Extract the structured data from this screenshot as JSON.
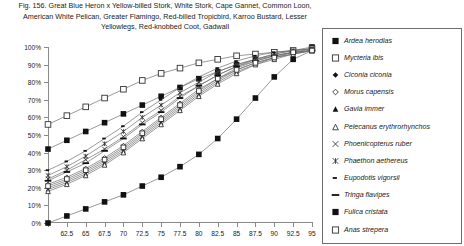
{
  "figure": {
    "title_lines": [
      "Fig. 156.  Great Blue Heron x Yellow-billed Stork, White Stork, Cape Gannet, Common Loon,",
      "American White Pelican, Greater Flamingo, Red-billed Tropicbird, Karroo Bustard, Lesser",
      "Yellowlegs, Red-knobbed Coot, Gadwall"
    ]
  },
  "chart_data": {
    "type": "line",
    "xlabel": "",
    "ylabel": "",
    "grid": false,
    "legend_position": "right",
    "xlim": [
      60,
      95
    ],
    "ylim": [
      0,
      100
    ],
    "x": [
      60,
      62.5,
      65,
      67.5,
      70,
      72.5,
      75,
      77.5,
      80,
      82.5,
      85,
      87.5,
      90,
      92.5,
      95
    ],
    "xticks": [
      "",
      "62.5",
      "65",
      "67.5",
      "70",
      "72.5",
      "75",
      "77.5",
      "80",
      "82.5",
      "85",
      "87.5",
      "90",
      "92.5",
      "95"
    ],
    "yticks": [
      "0%",
      "10%",
      "20%",
      "30%",
      "40%",
      "50%",
      "60%",
      "70%",
      "80%",
      "90%",
      "100%"
    ],
    "series": [
      {
        "name": "Ardea herodias",
        "marker": "filled-square",
        "values": [
          42,
          47,
          52,
          57,
          62,
          67,
          72,
          77,
          82,
          86,
          90,
          93,
          96,
          98,
          100
        ]
      },
      {
        "name": "Mycteria ibis",
        "marker": "open-square",
        "values": [
          56,
          61,
          66,
          71,
          76,
          81,
          85,
          88,
          91,
          93,
          95,
          96,
          97,
          98,
          99
        ]
      },
      {
        "name": "Ciconia ciconia",
        "marker": "filled-diamond",
        "values": [
          20,
          24,
          29,
          35,
          42,
          50,
          58,
          66,
          74,
          81,
          87,
          91,
          94,
          96,
          98
        ]
      },
      {
        "name": "Morus capensis",
        "marker": "open-diamond",
        "values": [
          22,
          26,
          31,
          37,
          44,
          52,
          60,
          68,
          76,
          82,
          88,
          92,
          95,
          97,
          98
        ]
      },
      {
        "name": "Gavia immer",
        "marker": "filled-triangle",
        "values": [
          19,
          23,
          28,
          34,
          41,
          49,
          57,
          65,
          73,
          80,
          86,
          90,
          94,
          96,
          98
        ]
      },
      {
        "name": "Pelecanus erythrorhynchos",
        "marker": "open-triangle",
        "values": [
          18,
          22,
          27,
          33,
          40,
          48,
          56,
          64,
          72,
          79,
          85,
          90,
          93,
          96,
          98
        ]
      },
      {
        "name": "Phoenicopterus ruber",
        "marker": "x-cross",
        "values": [
          25,
          30,
          36,
          42,
          49,
          57,
          64,
          72,
          78,
          84,
          89,
          93,
          95,
          97,
          99
        ]
      },
      {
        "name": "Phaethon aethereus",
        "marker": "star-cross",
        "values": [
          27,
          32,
          38,
          45,
          52,
          60,
          67,
          74,
          80,
          86,
          90,
          93,
          96,
          98,
          99
        ]
      },
      {
        "name": "Eupodotis vigorsii",
        "marker": "short-dash",
        "values": [
          30,
          35,
          41,
          48,
          55,
          63,
          70,
          77,
          83,
          88,
          92,
          95,
          97,
          98,
          99
        ]
      },
      {
        "name": "Tringa flavipes",
        "marker": "long-dash",
        "values": [
          24,
          29,
          34,
          41,
          48,
          56,
          63,
          71,
          78,
          84,
          89,
          92,
          95,
          97,
          98
        ]
      },
      {
        "name": "Fulica cristata",
        "marker": "filled-square",
        "values": [
          0,
          4,
          8,
          12,
          16,
          21,
          26,
          32,
          39,
          48,
          59,
          71,
          83,
          93,
          98
        ]
      },
      {
        "name": "Anas strepera",
        "marker": "open-square",
        "values": [
          21,
          25,
          30,
          36,
          43,
          51,
          59,
          67,
          75,
          82,
          87,
          91,
          94,
          97,
          98
        ]
      }
    ]
  },
  "legend": {
    "items": [
      {
        "label": "Ardea herodias",
        "marker": "filled-square"
      },
      {
        "label": "Mycteria ibis",
        "marker": "open-square"
      },
      {
        "label": "Ciconia ciconia",
        "marker": "filled-diamond"
      },
      {
        "label": "Morus capensis",
        "marker": "open-diamond"
      },
      {
        "label": "Gavia immer",
        "marker": "filled-triangle"
      },
      {
        "label": "Pelecanus erythrorhynchos",
        "marker": "open-triangle"
      },
      {
        "label": "Phoenicopterus ruber",
        "marker": "x-cross"
      },
      {
        "label": "Phaethon aethereus",
        "marker": "star-cross"
      },
      {
        "label": "Eupodotis vigorsii",
        "marker": "short-dash"
      },
      {
        "label": "Tringa flavipes",
        "marker": "long-dash"
      },
      {
        "label": "Fulica cristata",
        "marker": "filled-square"
      },
      {
        "label": "Anas strepera",
        "marker": "open-square"
      }
    ]
  },
  "colors": {
    "ink": "#1a1a1a",
    "axis": "#8a8a8a",
    "line": "#6e6e6e",
    "marker_fill": "#111111",
    "marker_open": "#ffffff",
    "legend_border": "#6e6e6e"
  }
}
